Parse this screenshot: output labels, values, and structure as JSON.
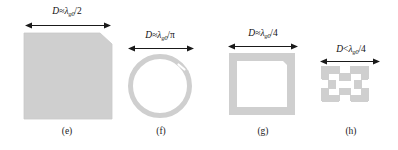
{
  "figure": {
    "background_color": "#ffffff",
    "shape_fill_color": "#cfcfcf",
    "shape_stroke_color": "#c4c4c4",
    "text_color": "#111111",
    "arrow_color": "#1a1a1a",
    "width": 398,
    "height": 150
  },
  "panels": [
    {
      "id": "e",
      "caption": "(e)",
      "dimension": {
        "symbol": "D",
        "relation": "≈",
        "lambda": "λ",
        "subscript": "g0",
        "divider": "/",
        "denominator": "2",
        "full_text": "D≈λg0/2"
      },
      "shape_name": "chamfered-square-patch",
      "shape_description": "solid filled square patch with chamfered top-right corner"
    },
    {
      "id": "f",
      "caption": "(f)",
      "dimension": {
        "symbol": "D",
        "relation": "≈",
        "lambda": "λ",
        "subscript": "g0",
        "divider": "/",
        "denominator": "π",
        "full_text": "D≈λg0/π"
      },
      "shape_name": "split-ring-resonator",
      "shape_description": "circular open ring with small gap at upper right"
    },
    {
      "id": "g",
      "caption": "(g)",
      "dimension": {
        "symbol": "D",
        "relation": "≈",
        "lambda": "λ",
        "subscript": "g0",
        "divider": "/",
        "denominator": "4",
        "full_text": "D≈λg0/4"
      },
      "shape_name": "square-loop-resonator",
      "shape_description": "square ring loop with thick border and hollow centre"
    },
    {
      "id": "h",
      "caption": "(h)",
      "dimension": {
        "symbol": "D",
        "relation": "<",
        "lambda": "λ",
        "subscript": "g0",
        "divider": "/",
        "denominator": "4",
        "full_text": "D<λg0/4"
      },
      "shape_name": "minkowski-fractal-loop",
      "shape_description": "square loop with Minkowski fractal indentations on each side"
    }
  ]
}
